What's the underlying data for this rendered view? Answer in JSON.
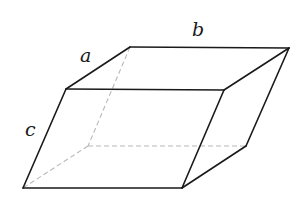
{
  "diagram": {
    "type": "parallelepiped",
    "labels": {
      "a": "a",
      "b": "b",
      "c": "c"
    },
    "colors": {
      "edge": "#1a1a1a",
      "hidden_edge": "#b8b8b8",
      "background": "#ffffff"
    },
    "vertices": {
      "top_back_left": [
        130,
        47
      ],
      "top_back_right": [
        289,
        48
      ],
      "top_front_left": [
        66,
        89
      ],
      "top_front_right": [
        224,
        90
      ],
      "bottom_front_left": [
        23,
        188
      ],
      "bottom_front_right": [
        182,
        188
      ],
      "bottom_back_right": [
        246,
        146
      ],
      "bottom_back_left": [
        88,
        146
      ]
    }
  }
}
